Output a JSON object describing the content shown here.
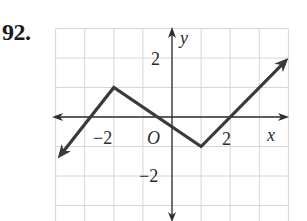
{
  "problem": {
    "number": "92."
  },
  "chart_data": {
    "type": "line",
    "title": "",
    "xlabel": "x",
    "ylabel": "y",
    "origin_label": "O",
    "x_tick_labels": [
      {
        "value": -2,
        "label": "−2"
      },
      {
        "value": 2,
        "label": "2"
      }
    ],
    "y_tick_labels": [
      {
        "value": 2,
        "label": "2"
      },
      {
        "value": -2,
        "label": "−2"
      }
    ],
    "xlim": [
      -4,
      4
    ],
    "ylim": [
      -4,
      3
    ],
    "grid": true,
    "grid_step": 1,
    "legend": null,
    "series": [
      {
        "name": "piecewise linear graph",
        "x": [
          -3.93,
          -2,
          1,
          4
        ],
        "y": [
          -1.41,
          1,
          -1,
          2
        ],
        "arrows": [
          "start",
          "end"
        ],
        "key_points": [
          {
            "x": -2,
            "y": 1,
            "type": "local max"
          },
          {
            "x": 1,
            "y": -1,
            "type": "local min"
          },
          {
            "x": 2,
            "y": 0,
            "type": "x-intercept"
          },
          {
            "x": -0.5,
            "y": 0,
            "type": "x-intercept"
          }
        ]
      }
    ]
  },
  "colors": {
    "grid": "#d6d6d6",
    "axis": "#2e2e2e",
    "curve": "#3a3a3a",
    "text": "#2a2a2a"
  }
}
